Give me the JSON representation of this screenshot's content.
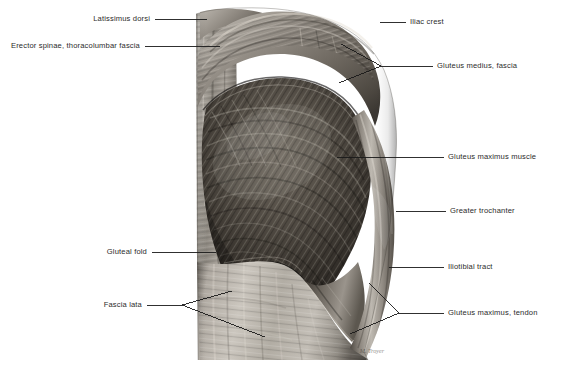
{
  "figure": {
    "view": "posterior",
    "signature": "M. Troyer",
    "colors": {
      "background": "#ffffff",
      "leader_line": "#1a1a1a",
      "label_text": "#2b2b2b",
      "skin_light": "#c9c5bf",
      "fascia_mid": "#9d9890",
      "muscle_dark": "#4a4641",
      "muscle_deep": "#2e2b27"
    }
  },
  "labels": {
    "left": [
      {
        "id": "latissimus-dorsi",
        "text": "Latissimus dorsi",
        "text_x": 150,
        "text_y": 19,
        "line": [
          [
            155,
            19
          ],
          [
            207,
            19
          ]
        ]
      },
      {
        "id": "erector-spinae",
        "text": "Erector spinae, thoracolumbar fascia",
        "text_x": 140,
        "text_y": 46,
        "line": [
          [
            145,
            46
          ],
          [
            220,
            46
          ]
        ]
      },
      {
        "id": "gluteal-fold",
        "text": "Gluteal fold",
        "text_x": 147,
        "text_y": 252,
        "line": [
          [
            152,
            252
          ],
          [
            216,
            252
          ]
        ]
      },
      {
        "id": "fascia-lata",
        "text": "Fascia lata",
        "text_x": 142,
        "text_y": 305,
        "fork": {
          "stem": [
            [
              147,
              305
            ],
            [
              182,
              305
            ]
          ],
          "branches": [
            [
              [
                182,
                305
              ],
              [
                232,
                291
              ]
            ],
            [
              [
                182,
                305
              ],
              [
                265,
                337
              ]
            ]
          ]
        }
      }
    ],
    "right": [
      {
        "id": "iliac-crest",
        "text": "Iliac crest",
        "text_x": 410,
        "text_y": 22,
        "line": [
          [
            380,
            22
          ],
          [
            406,
            22
          ]
        ]
      },
      {
        "id": "gluteus-medius-fascia",
        "text": "Gluteus medius, fascia",
        "text_x": 437,
        "text_y": 66,
        "fork": {
          "stem": [
            [
              433,
              66
            ],
            [
              381,
              66
            ]
          ],
          "branches": [
            [
              [
                381,
                66
              ],
              [
                341,
                44
              ]
            ],
            [
              [
                381,
                66
              ],
              [
                339,
                83
              ]
            ]
          ]
        }
      },
      {
        "id": "gluteus-maximus-muscle",
        "text": "Gluteus maximus muscle",
        "text_x": 448,
        "text_y": 157,
        "line": [
          [
            337,
            157
          ],
          [
            444,
            157
          ]
        ]
      },
      {
        "id": "greater-trochanter",
        "text": "Greater trochanter",
        "text_x": 450,
        "text_y": 211,
        "line": [
          [
            396,
            211
          ],
          [
            446,
            211
          ]
        ]
      },
      {
        "id": "iliotibial-tract",
        "text": "Iliotibial tract",
        "text_x": 448,
        "text_y": 267,
        "line": [
          [
            389,
            267
          ],
          [
            444,
            267
          ]
        ]
      },
      {
        "id": "gluteus-maximus-tendon",
        "text": "Gluteus maximus, tendon",
        "text_x": 448,
        "text_y": 313,
        "fork": {
          "stem": [
            [
              444,
              313
            ],
            [
              399,
              313
            ]
          ],
          "branches": [
            [
              [
                399,
                313
              ],
              [
                369,
                283
              ]
            ],
            [
              [
                399,
                313
              ],
              [
                350,
                334
              ]
            ]
          ]
        }
      }
    ]
  }
}
